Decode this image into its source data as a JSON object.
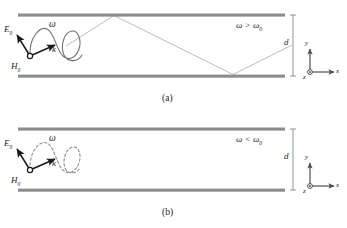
{
  "figure": {
    "type": "physics-diagram",
    "colors": {
      "wall": "#8c8c8c",
      "ray": "#b3b3b3",
      "wave": "#6e6e6e",
      "vector": "#1a1a1a",
      "axis": "#4d4d4d",
      "text": "#1d1d1d"
    }
  },
  "panels": [
    {
      "id": "a",
      "caption": "(a)",
      "condition": "ω > ω",
      "condition_sub": "0",
      "condition_full": "ω > ω₀",
      "wave_style": "solid",
      "has_ray_path": true,
      "labels": {
        "e_field": "E",
        "e_field_sub": "0",
        "h_field": "H",
        "h_field_sub": "0",
        "wavevector": "k",
        "frequency": "ω"
      },
      "dimension": {
        "label": "d"
      },
      "axes": {
        "y": "y",
        "x": "x",
        "z": "z"
      }
    },
    {
      "id": "b",
      "caption": "(b)",
      "condition": "ω < ω",
      "condition_sub": "0",
      "condition_full": "ω < ω₀",
      "wave_style": "dashed",
      "has_ray_path": false,
      "labels": {
        "e_field": "E",
        "e_field_sub": "0",
        "h_field": "H",
        "h_field_sub": "0",
        "wavevector": "k",
        "frequency": "ω"
      },
      "dimension": {
        "label": "d"
      },
      "axes": {
        "y": "y",
        "x": "x",
        "z": "z"
      }
    }
  ]
}
